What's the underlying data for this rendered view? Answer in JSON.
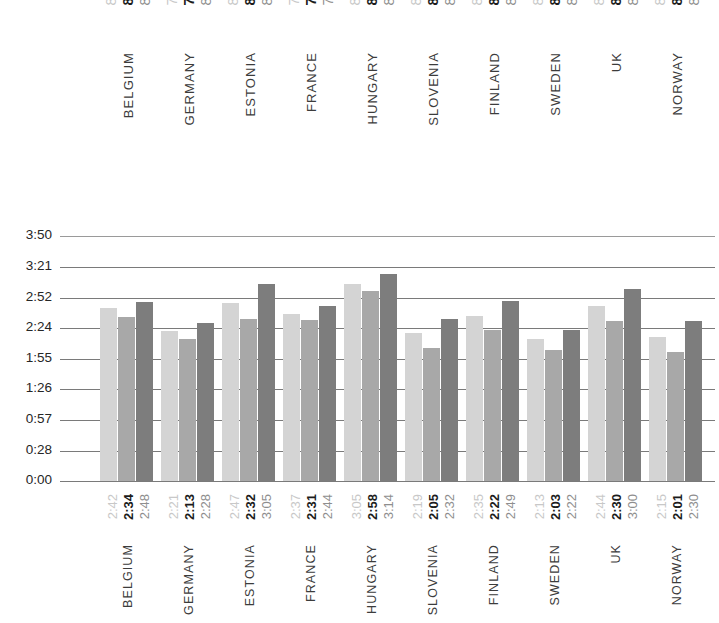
{
  "chart_data": {
    "type": "bar",
    "title": "",
    "xlabel": "",
    "ylabel": "",
    "categories": [
      "BELGIUM",
      "GERMANY",
      "ESTONIA",
      "FRANCE",
      "HUNGARY",
      "SLOVENIA",
      "FINLAND",
      "SWEDEN",
      "UK",
      "NORWAY"
    ],
    "ylim": [
      "0:00",
      "3:50"
    ],
    "y_ticks": [
      "3:50",
      "3:21",
      "2:52",
      "2:24",
      "1:55",
      "1:26",
      "0:57",
      "0:28",
      "0:00"
    ],
    "y_tick_minutes": [
      230,
      201,
      172,
      144,
      115,
      86,
      57,
      28,
      0
    ],
    "grid": true,
    "legend": "none",
    "series": [
      {
        "name": "series-1",
        "color": "#d4d4d4",
        "labels": [
          "2:42",
          "2:21",
          "2:47",
          "2:37",
          "3:05",
          "2:19",
          "2:35",
          "2:13",
          "2:44",
          "2:15"
        ],
        "values": [
          162,
          141,
          167,
          157,
          185,
          139,
          155,
          133,
          164,
          135
        ]
      },
      {
        "name": "series-2",
        "color": "#a8a8a8",
        "labels": [
          "2:34",
          "2:13",
          "2:32",
          "2:31",
          "2:58",
          "2:05",
          "2:22",
          "2:03",
          "2:30",
          "2:01"
        ],
        "values": [
          154,
          133,
          152,
          151,
          178,
          125,
          142,
          123,
          150,
          121
        ]
      },
      {
        "name": "series-3",
        "color": "#7d7d7d",
        "labels": [
          "2:48",
          "2:28",
          "3:05",
          "2:44",
          "3:14",
          "2:32",
          "2:49",
          "2:22",
          "3:00",
          "2:30"
        ],
        "values": [
          168,
          148,
          185,
          164,
          194,
          152,
          169,
          142,
          180,
          150
        ]
      }
    ]
  },
  "top_section": {
    "groups": [
      {
        "country": "BELGIUM",
        "values": [
          "84",
          "84",
          "85"
        ]
      },
      {
        "country": "GERMANY",
        "values": [
          "78",
          "76",
          "80"
        ]
      },
      {
        "country": "ESTONIA",
        "values": [
          "85",
          "86",
          "86"
        ]
      },
      {
        "country": "FRANCE",
        "values": [
          "77",
          "76",
          "78"
        ]
      },
      {
        "country": "HUNGARY",
        "values": [
          "89",
          "88",
          "87"
        ]
      },
      {
        "country": "SLOVENIA",
        "values": [
          "85",
          "83",
          "87"
        ]
      },
      {
        "country": "FINLAND",
        "values": [
          "86",
          "86",
          "86"
        ]
      },
      {
        "country": "SWEDEN",
        "values": [
          "82",
          "81",
          "83"
        ]
      },
      {
        "country": "UK",
        "values": [
          "87",
          "86",
          "87"
        ]
      },
      {
        "country": "NORWAY",
        "values": [
          "83",
          "82",
          "84"
        ]
      }
    ]
  },
  "bottom_section": {
    "groups": [
      {
        "country": "BELGIUM",
        "values": [
          "2:42",
          "2:34",
          "2:48"
        ]
      },
      {
        "country": "GERMANY",
        "values": [
          "2:21",
          "2:13",
          "2:28"
        ]
      },
      {
        "country": "ESTONIA",
        "values": [
          "2:47",
          "2:32",
          "3:05"
        ]
      },
      {
        "country": "FRANCE",
        "values": [
          "2:37",
          "2:31",
          "2:44"
        ]
      },
      {
        "country": "HUNGARY",
        "values": [
          "3:05",
          "2:58",
          "3:14"
        ]
      },
      {
        "country": "SLOVENIA",
        "values": [
          "2:19",
          "2:05",
          "2:32"
        ]
      },
      {
        "country": "FINLAND",
        "values": [
          "2:35",
          "2:22",
          "2:49"
        ]
      },
      {
        "country": "SWEDEN",
        "values": [
          "2:13",
          "2:03",
          "2:22"
        ]
      },
      {
        "country": "UK",
        "values": [
          "2:44",
          "2:30",
          "3:00"
        ]
      },
      {
        "country": "NORWAY",
        "values": [
          "2:15",
          "2:01",
          "2:30"
        ]
      }
    ]
  },
  "colors": {
    "series_1": "#d4d4d4",
    "series_2": "#a8a8a8",
    "series_3": "#7d7d7d",
    "gridline": "#7a7a7a",
    "faint_text": "#c8c8c8",
    "bold_text": "#1c1c1c",
    "country_text": "#3c3c3c"
  }
}
